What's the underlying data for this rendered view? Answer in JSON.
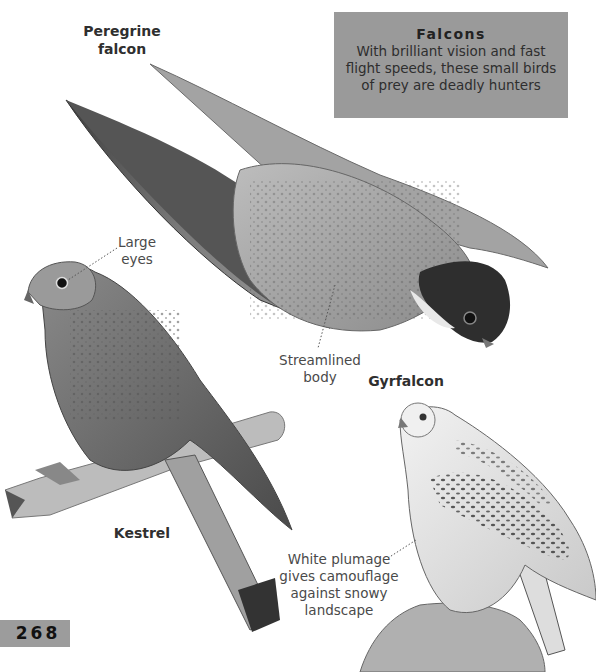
{
  "info_box": {
    "title": "Falcons",
    "body_lines": [
      "With brilliant vision and fast",
      "flight speeds, these small birds",
      "of prey are deadly hunters"
    ],
    "background_color": "#9a9a9a"
  },
  "species": {
    "peregrine": {
      "name_lines": [
        "Peregrine",
        "falcon"
      ]
    },
    "kestrel": {
      "name": "Kestrel"
    },
    "gyrfalcon": {
      "name": "Gyrfalcon"
    }
  },
  "annotations": {
    "large_eyes": {
      "lines": [
        "Large",
        "eyes"
      ]
    },
    "streamlined": {
      "lines": [
        "Streamlined",
        "body"
      ]
    },
    "white_plumage": {
      "lines": [
        "White plumage",
        "gives camouflage",
        "against snowy",
        "landscape"
      ]
    }
  },
  "page": {
    "number": "268",
    "tab_color": "#9c9c9c"
  },
  "illustrations": [
    {
      "name": "peregrine-falcon-illustration",
      "description": "Peregrine falcon in stoop dive, wings folded back"
    },
    {
      "name": "kestrel-illustration",
      "description": "Kestrel perched on broken branch"
    },
    {
      "name": "gyrfalcon-illustration",
      "description": "White gyrfalcon perched on rock"
    }
  ]
}
